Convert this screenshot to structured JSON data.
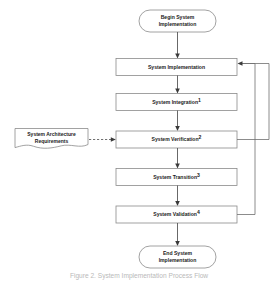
{
  "diagram": {
    "title": "System Implementation Process Flow",
    "type": "flowchart",
    "orientation": "vertical",
    "colors": {
      "box_stroke": "#8a8a8a",
      "line": "#4d4d4d",
      "feedback_line": "#6e6e6e",
      "text": "#1a1a1a",
      "caption": "#b9b9b9",
      "background": "#ffffff"
    },
    "start_node": {
      "shape": "terminator-oval",
      "line1": "Begin System",
      "line2": "Implementation"
    },
    "end_node": {
      "shape": "terminator-oval",
      "line1": "End System",
      "line2": "Implementation"
    },
    "process_nodes": [
      {
        "id": "implementation",
        "shape": "rectangle",
        "label": "System Implementation",
        "superscript": ""
      },
      {
        "id": "integration",
        "shape": "rectangle",
        "label": "System Integration",
        "superscript": "1"
      },
      {
        "id": "verification",
        "shape": "rectangle",
        "label": "System Verification",
        "superscript": "2"
      },
      {
        "id": "transition",
        "shape": "rectangle",
        "label": "System Transition",
        "superscript": "3"
      },
      {
        "id": "validation",
        "shape": "rectangle",
        "label": "System Validation",
        "superscript": "4"
      }
    ],
    "input_document": {
      "shape": "document-wavy-bottom",
      "line1": "System Architecture",
      "line2": "Requirements",
      "connector": "dashed-arrow",
      "target": "verification"
    },
    "feedback_loops": [
      {
        "from": "verification",
        "to": "implementation",
        "style": "solid",
        "routing": "right-side-outer"
      },
      {
        "from": "validation",
        "to": "implementation",
        "style": "solid",
        "routing": "right-side-inner"
      }
    ],
    "caption": "Figure 2. System Implementation Process Flow"
  }
}
